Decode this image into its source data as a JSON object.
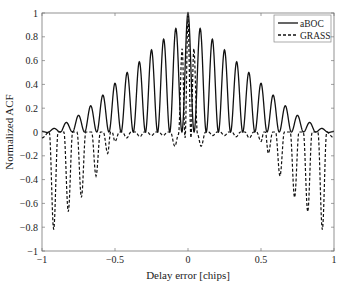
{
  "chart_data": {
    "type": "line",
    "title": "",
    "xlabel": "Delay error [chips]",
    "ylabel": "Normalized ACF",
    "xlim": [
      -1,
      1
    ],
    "ylim": [
      -1,
      1
    ],
    "xticks": [
      -1,
      -0.5,
      0,
      0.5,
      1
    ],
    "xtick_labels": [
      "−1",
      "−0.5",
      "0",
      "0.5",
      "1"
    ],
    "yticks": [
      1,
      0.8,
      0.6,
      0.4,
      0.2,
      0,
      -0.2,
      -0.4,
      -0.6,
      -0.8,
      -1
    ],
    "ytick_labels": [
      "1",
      "0.8",
      "0.6",
      "0.4",
      "0.2",
      "0",
      "−0.2",
      "−0.4",
      "−0.6",
      "−0.8",
      "−1"
    ],
    "grid": false,
    "legend_position": "upper right",
    "series": [
      {
        "name": "aBOC",
        "style": "solid",
        "color": "#111111",
        "peak_spacing": 0.0833,
        "peak_x_right": [
          0,
          0.083,
          0.167,
          0.25,
          0.333,
          0.417,
          0.5,
          0.583,
          0.667,
          0.75,
          0.833,
          0.917
        ],
        "peak_values": [
          1.0,
          0.87,
          0.78,
          0.69,
          0.59,
          0.5,
          0.41,
          0.31,
          0.22,
          0.14,
          0.08,
          0.03
        ],
        "trough_value": 0.0,
        "symmetric": true
      },
      {
        "name": "GRASS",
        "style": "dashed",
        "color": "#111111",
        "central_peaks": {
          "x": [
            -0.04,
            0,
            0.04
          ],
          "y": [
            0.7,
            0.95,
            0.7
          ]
        },
        "dip_x_right": [
          0.09,
          0.17,
          0.25,
          0.33,
          0.42,
          0.5,
          0.55,
          0.63,
          0.73,
          0.82,
          0.92
        ],
        "dip_values": [
          -0.12,
          -0.03,
          -0.03,
          -0.04,
          -0.05,
          -0.08,
          -0.18,
          -0.37,
          -0.55,
          -0.67,
          -0.82
        ],
        "symmetric": true
      }
    ]
  },
  "legend": {
    "items": [
      {
        "label": "aBOC",
        "style": "solid"
      },
      {
        "label": "GRASS",
        "style": "dashed"
      }
    ]
  }
}
